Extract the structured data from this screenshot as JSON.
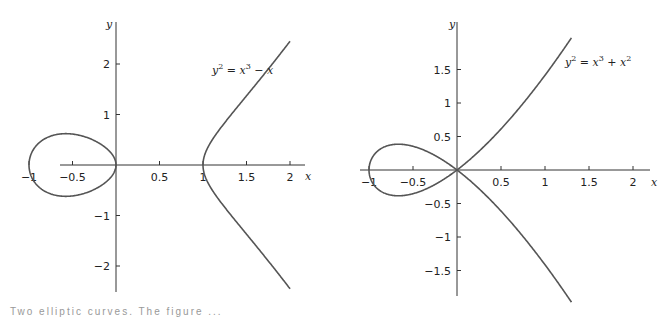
{
  "chart_data": [
    {
      "type": "line",
      "title": "",
      "equation": {
        "lhs": "y",
        "lhs_exp": "2",
        "rhs_1": "x",
        "rhs_1_exp": "3",
        "op": " − ",
        "rhs_2": "x",
        "rhs_2_exp": ""
      },
      "equation_text": "y^2 = x^3 − x",
      "xlabel": "x",
      "ylabel": "y",
      "xlim": [
        -1.1,
        2.3
      ],
      "ylim": [
        -2.4,
        2.4
      ],
      "x_ticks": [
        -1,
        -0.5,
        0.5,
        1,
        1.5,
        2
      ],
      "x_tick_labels": [
        "−1",
        "−0.5",
        "0.5",
        "1",
        "1.5",
        "2"
      ],
      "y_ticks": [
        2,
        1,
        -1,
        -2
      ],
      "y_tick_labels": [
        "2",
        "1",
        "−1",
        "−2"
      ],
      "grid": false,
      "series": [
        {
          "name": "oval",
          "x_range": [
            -1,
            0
          ],
          "points": [
            [
              -1,
              0
            ],
            [
              -0.577,
              0.62
            ],
            [
              0,
              0
            ],
            [
              -0.577,
              -0.62
            ],
            [
              -1,
              0
            ]
          ]
        },
        {
          "name": "branch",
          "x_range": [
            1,
            2
          ],
          "points": [
            [
              2,
              -2.449
            ],
            [
              1.5,
              -1.369
            ],
            [
              1,
              0
            ],
            [
              1.5,
              1.369
            ],
            [
              2,
              2.449
            ]
          ]
        }
      ],
      "layout": {
        "ox": 116,
        "oy": 165,
        "sx": 87,
        "sy": 50.5,
        "x_axis": [
          60,
          305
        ],
        "y_axis": [
          22,
          292
        ],
        "eq_pos": [
          212,
          74
        ],
        "ylabel_pos": [
          106,
          28
        ],
        "xlabel_pos": [
          305,
          180
        ]
      }
    },
    {
      "type": "line",
      "title": "",
      "equation": {
        "lhs": "y",
        "lhs_exp": "2",
        "rhs_1": "x",
        "rhs_1_exp": "3",
        "op": " + ",
        "rhs_2": "x",
        "rhs_2_exp": "2"
      },
      "equation_text": "y^2 = x^3 + x^2",
      "xlabel": "x",
      "ylabel": "y",
      "xlim": [
        -1.1,
        2.2
      ],
      "ylim": [
        -1.9,
        1.95
      ],
      "x_ticks": [
        -1,
        -0.5,
        0.5,
        1,
        1.5,
        2
      ],
      "x_tick_labels": [
        "−1",
        "−0.5",
        "0.5",
        "1",
        "1.5",
        "2"
      ],
      "y_ticks": [
        1.5,
        1,
        0.5,
        -0.5,
        -1,
        -1.5
      ],
      "y_tick_labels": [
        "1.5",
        "1",
        "0.5",
        "−0.5",
        "−1",
        "−1.5"
      ],
      "grid": false,
      "series": [
        {
          "name": "loop",
          "x_range": [
            -1,
            0
          ],
          "points": [
            [
              -1,
              0
            ],
            [
              -0.667,
              0.385
            ],
            [
              0,
              0
            ],
            [
              -0.667,
              -0.385
            ],
            [
              -1,
              0
            ]
          ]
        },
        {
          "name": "branch",
          "x_range": [
            0,
            1.3
          ],
          "points": [
            [
              1.3,
              -1.97
            ],
            [
              1,
              -1.414
            ],
            [
              0.5,
              -0.612
            ],
            [
              0,
              0
            ],
            [
              0.5,
              0.612
            ],
            [
              1,
              1.414
            ],
            [
              1.3,
              1.97
            ]
          ]
        }
      ],
      "layout": {
        "ox": 457,
        "oy": 170,
        "sx": 88,
        "sy": 67,
        "x_axis": [
          360,
          650
        ],
        "y_axis": [
          22,
          296
        ],
        "eq_pos": [
          565,
          66
        ],
        "ylabel_pos": [
          449,
          28
        ],
        "xlabel_pos": [
          651,
          186
        ]
      }
    }
  ],
  "caption_fragment": "Two elliptic curves. The figure ..."
}
